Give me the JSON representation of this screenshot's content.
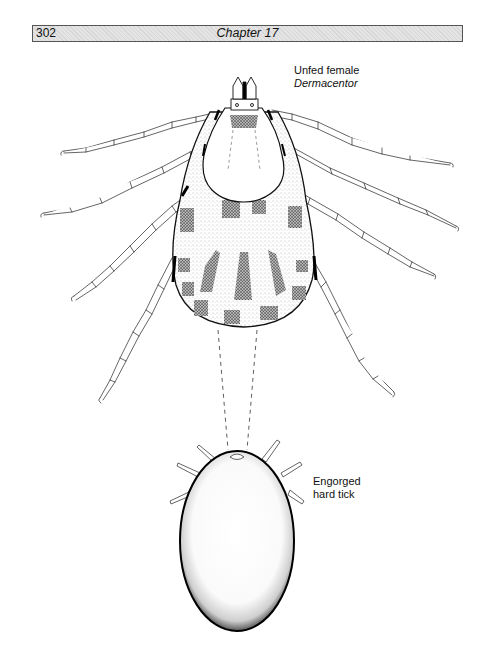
{
  "header": {
    "page_number": "302",
    "chapter_title": "Chapter 17"
  },
  "figure": {
    "labels": {
      "unfed": {
        "line1": "Unfed female",
        "line2": "Dermacentor"
      },
      "engorged": {
        "line1": "Engorged",
        "line2": "hard tick"
      }
    },
    "colors": {
      "ink": "#111111",
      "stipple": "#8a8a8a",
      "header_bg": "#e4e4e4"
    }
  }
}
